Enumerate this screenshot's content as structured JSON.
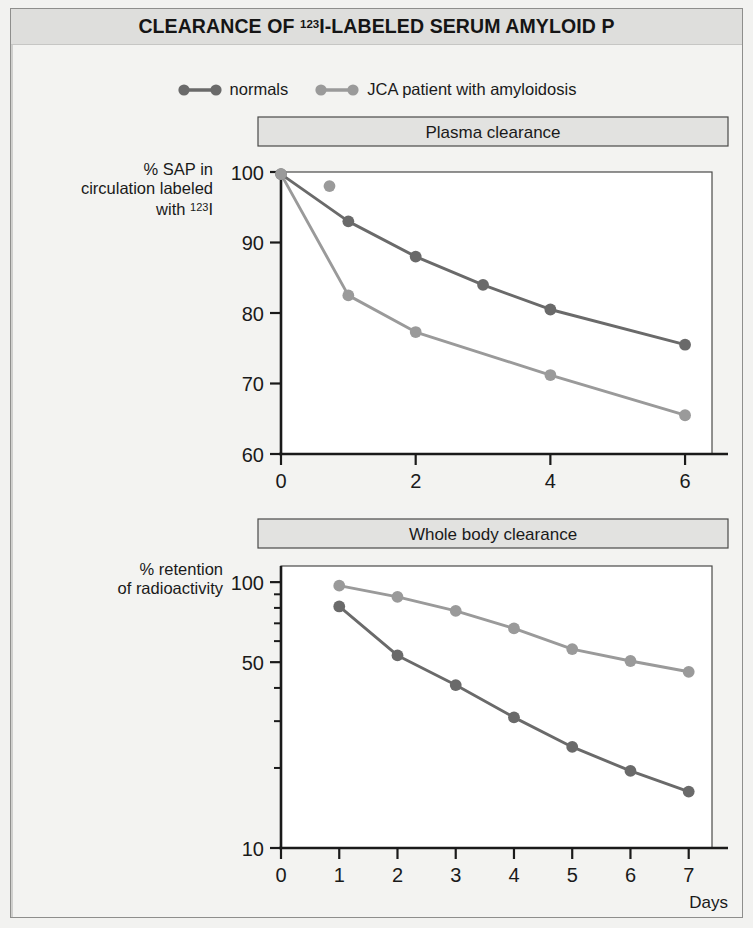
{
  "header": {
    "title_prefix": "CLEARANCE OF ",
    "title_sup": "123",
    "title_suffix": "I-LABELED SERUM AMYLOID P",
    "title_plain": "CLEARANCE OF 123I-LABELED SERUM AMYLOID P"
  },
  "legend": {
    "entries": [
      {
        "label": "normals",
        "color": "#6a6a6a"
      },
      {
        "label": "JCA patient with amyloidosis",
        "color": "#9a9a9a"
      }
    ]
  },
  "colors": {
    "normals": "#6a6a6a",
    "patient": "#9a9a9a",
    "axis": "#1a1a1a",
    "panel_title_bg": "#e2e2e0",
    "plate_bg": "#f3f3f1",
    "header_bg": "#dededc",
    "frame": "#8e8e8c"
  },
  "chart_data": [
    {
      "type": "line",
      "title": "Plasma clearance",
      "xlabel": "Hours",
      "ylabel_lines": [
        "% SAP in",
        "circulation labeled",
        "with 123I"
      ],
      "ylabel": "% SAP in circulation labeled with 123I",
      "yscale": "linear",
      "xlim": [
        0,
        6.4
      ],
      "ylim": [
        60,
        100
      ],
      "xticks": [
        0,
        2,
        4,
        6
      ],
      "xticklabels": [
        "0",
        "2",
        "4",
        "6"
      ],
      "yticks": [
        60,
        70,
        80,
        90,
        100
      ],
      "yticklabels": [
        "60",
        "70",
        "80",
        "90",
        "100"
      ],
      "grid": false,
      "legend_position": "above-figure",
      "series": [
        {
          "name": "normals",
          "color": "#6a6a6a",
          "x": [
            0,
            1,
            2,
            3,
            4,
            6
          ],
          "values": [
            99.7,
            93.0,
            88.0,
            84.0,
            80.5,
            75.5
          ]
        },
        {
          "name": "JCA patient with amyloidosis",
          "color": "#9a9a9a",
          "x": [
            0,
            1,
            2,
            4,
            6
          ],
          "values": [
            99.7,
            82.5,
            77.3,
            71.2,
            65.5
          ],
          "extra_points": [
            {
              "x": 0.72,
              "y": 98.0
            }
          ]
        }
      ]
    },
    {
      "type": "line",
      "title": "Whole body clearance",
      "xlabel": "Days",
      "ylabel_lines": [
        "% retention",
        "of radioactivity"
      ],
      "ylabel": "% retention of radioactivity",
      "yscale": "log",
      "xlim": [
        0,
        7.4
      ],
      "ylim": [
        10,
        115
      ],
      "xticks": [
        0,
        1,
        2,
        3,
        4,
        5,
        6,
        7
      ],
      "xticklabels": [
        "0",
        "1",
        "2",
        "3",
        "4",
        "5",
        "6",
        "7"
      ],
      "yticks": [
        100,
        50,
        10
      ],
      "yticklabels": [
        "100",
        "50",
        "10"
      ],
      "yminorticks": [
        90,
        80,
        70,
        60,
        40,
        30,
        20
      ],
      "grid": false,
      "legend_position": "above-figure",
      "series": [
        {
          "name": "normals",
          "color": "#6a6a6a",
          "x": [
            1,
            2,
            3,
            4,
            5,
            6,
            7
          ],
          "values": [
            81.0,
            53.0,
            41.0,
            31.0,
            24.0,
            19.5,
            16.3
          ]
        },
        {
          "name": "JCA patient with amyloidosis",
          "color": "#9a9a9a",
          "x": [
            1,
            2,
            3,
            4,
            5,
            6,
            7
          ],
          "values": [
            97.0,
            88.0,
            78.0,
            67.0,
            56.0,
            50.5,
            46.0
          ]
        }
      ]
    }
  ]
}
